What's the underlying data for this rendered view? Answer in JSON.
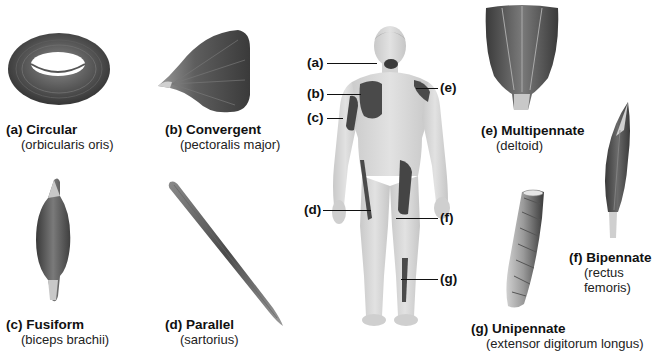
{
  "figure": {
    "muscle_types": [
      {
        "letter": "(a)",
        "name": "Circular",
        "example": "(orbicularis oris)"
      },
      {
        "letter": "(b)",
        "name": "Convergent",
        "example": "(pectoralis major)"
      },
      {
        "letter": "(c)",
        "name": "Fusiform",
        "example": "(biceps brachii)"
      },
      {
        "letter": "(d)",
        "name": "Parallel",
        "example": "(sartorius)"
      },
      {
        "letter": "(e)",
        "name": "Multipennate",
        "example": "(deltoid)"
      },
      {
        "letter": "(f)",
        "name": "Bipennate",
        "example_line1": "(rectus",
        "example_line2": "femoris)"
      },
      {
        "letter": "(g)",
        "name": "Unipennate",
        "example": "(extensor digitorum longus)"
      }
    ],
    "body_labels": [
      "(a)",
      "(b)",
      "(c)",
      "(d)",
      "(e)",
      "(f)",
      "(g)"
    ],
    "colors": {
      "muscle_dark": "#3a3a3a",
      "muscle_mid": "#6b6b6b",
      "skin": "#d9d9d9",
      "tendon": "#c8c8c8"
    }
  }
}
